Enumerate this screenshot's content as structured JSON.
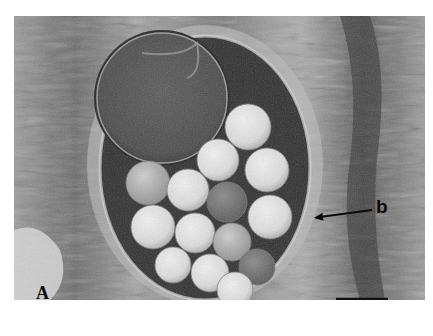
{
  "figure": {
    "panel_label": "A",
    "annotation_label": "b",
    "scale_bar": {
      "x1": 336,
      "x2": 388,
      "y": 299,
      "color": "#111111"
    }
  },
  "colors": {
    "background": "#ffffff",
    "tissue_dark": "#3a3a3a",
    "tissue_mid": "#8a8a8a",
    "tissue_light": "#d0d0d0",
    "sphere_light": "#e4e4e4",
    "sphere_dark": "#6e6e6e"
  },
  "large_sphere": {
    "cx": 162,
    "cy": 98,
    "r": 65
  },
  "small_spheres": [
    {
      "cx": 248,
      "cy": 127,
      "r": 23,
      "tone": "light"
    },
    {
      "cx": 218,
      "cy": 160,
      "r": 21,
      "tone": "light"
    },
    {
      "cx": 267,
      "cy": 170,
      "r": 22,
      "tone": "light"
    },
    {
      "cx": 148,
      "cy": 183,
      "r": 22,
      "tone": "mid"
    },
    {
      "cx": 188,
      "cy": 190,
      "r": 21,
      "tone": "light"
    },
    {
      "cx": 227,
      "cy": 202,
      "r": 20,
      "tone": "dark"
    },
    {
      "cx": 270,
      "cy": 217,
      "r": 22,
      "tone": "light"
    },
    {
      "cx": 153,
      "cy": 227,
      "r": 22,
      "tone": "light"
    },
    {
      "cx": 195,
      "cy": 233,
      "r": 20,
      "tone": "light"
    },
    {
      "cx": 232,
      "cy": 242,
      "r": 19,
      "tone": "mid"
    },
    {
      "cx": 173,
      "cy": 265,
      "r": 18,
      "tone": "light"
    },
    {
      "cx": 210,
      "cy": 273,
      "r": 19,
      "tone": "light"
    },
    {
      "cx": 257,
      "cy": 267,
      "r": 18,
      "tone": "dark"
    },
    {
      "cx": 235,
      "cy": 290,
      "r": 18,
      "tone": "light"
    }
  ],
  "arrow": {
    "x1": 372,
    "y1": 210,
    "x2": 314,
    "y2": 218
  }
}
